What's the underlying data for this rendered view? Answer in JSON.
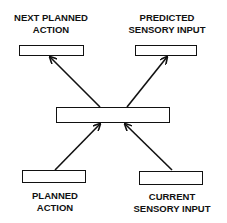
{
  "diagram": {
    "nodes": {
      "next_planned_action": {
        "line1": "NEXT PLANNED",
        "line2": "ACTION"
      },
      "predicted_sensory_input": {
        "line1": "PREDICTED",
        "line2": "SENSORY INPUT"
      },
      "central_model": {
        "label": ""
      },
      "planned_action": {
        "line1": "PLANNED",
        "line2": "ACTION"
      },
      "current_sensory_input": {
        "line1": "CURRENT",
        "line2": "SENSORY INPUT"
      }
    },
    "edges": [
      {
        "from": "planned_action",
        "to": "central_model"
      },
      {
        "from": "current_sensory_input",
        "to": "central_model"
      },
      {
        "from": "central_model",
        "to": "next_planned_action"
      },
      {
        "from": "central_model",
        "to": "predicted_sensory_input"
      }
    ]
  }
}
